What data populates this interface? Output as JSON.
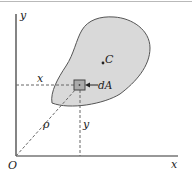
{
  "figure": {
    "axes": {
      "x_label": "x",
      "y_label": "y",
      "origin_label": "O"
    },
    "region": {
      "centroid_label": "C",
      "fill_color": "#d9d9d9",
      "stroke_color": "#555555"
    },
    "element": {
      "label": "dA",
      "x_distance_label": "x",
      "y_distance_label": "y",
      "radial_label": "ρ"
    },
    "colors": {
      "axis": "#333333",
      "dashed": "#666666",
      "background": "#ffffff"
    }
  }
}
